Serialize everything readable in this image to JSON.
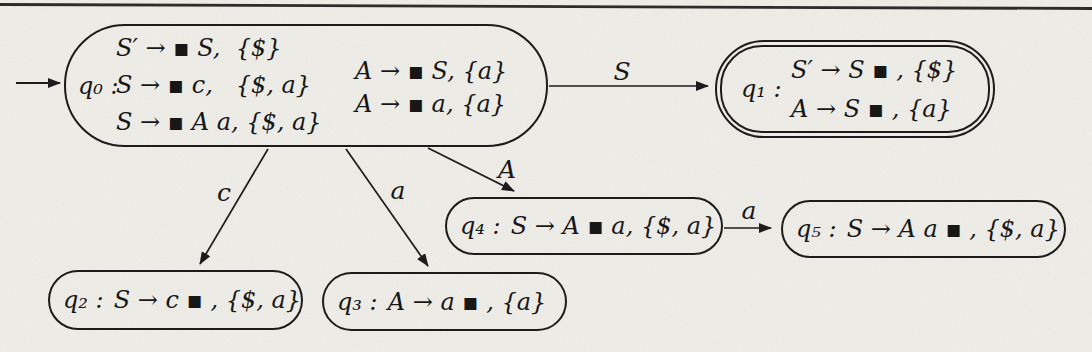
{
  "page": {
    "background": "#efede8",
    "ink": "#1c1c1c",
    "figure_type": "LR(1) parsing automaton state diagram"
  },
  "diagram": {
    "states": [
      {
        "key": "q0",
        "label": "q₀ :",
        "accepting": false,
        "start": true,
        "left_items": [
          "S′ → ▪ S,  {$}",
          "S → ▪ c,   {$, a}",
          "S → ▪ A a, {$, a}"
        ],
        "right_items": [
          "A → ▪ S, {a}",
          "A → ▪ a, {a}"
        ]
      },
      {
        "key": "q1",
        "label": "q₁ :",
        "accepting": true,
        "items": [
          "S′ → S ▪ , {$}",
          "A → S ▪ , {a}"
        ]
      },
      {
        "key": "q2",
        "label": "q₂ :",
        "accepting": false,
        "item": "S → c ▪ , {$, a}"
      },
      {
        "key": "q3",
        "label": "q₃ :",
        "accepting": false,
        "item": "A → a ▪ , {a}"
      },
      {
        "key": "q4",
        "label": "q₄ :",
        "accepting": false,
        "item": "S → A ▪ a, {$, a}"
      },
      {
        "key": "q5",
        "label": "q₅ :",
        "accepting": false,
        "item": "S → A a ▪ , {$, a}"
      }
    ],
    "edges": [
      {
        "from": "start",
        "to": "q0",
        "label": ""
      },
      {
        "from": "q0",
        "to": "q1",
        "label": "S"
      },
      {
        "from": "q0",
        "to": "q2",
        "label": "c"
      },
      {
        "from": "q0",
        "to": "q3",
        "label": "a"
      },
      {
        "from": "q0",
        "to": "q4",
        "label": "A"
      },
      {
        "from": "q4",
        "to": "q5",
        "label": "a"
      }
    ]
  }
}
